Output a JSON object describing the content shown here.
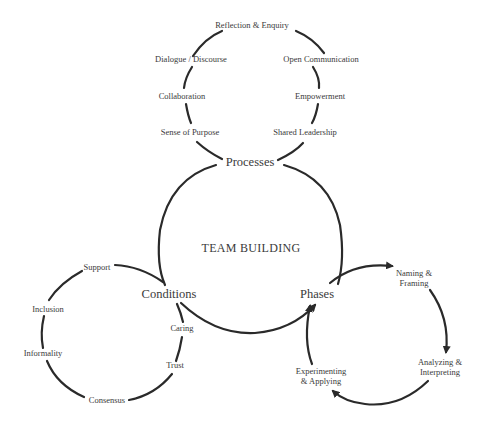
{
  "diagram": {
    "center_title": "TEAM BUILDING",
    "nodes": {
      "processes": "Processes",
      "conditions": "Conditions",
      "phases": "Phases"
    },
    "processes_cycle": [
      "Reflection & Enquiry",
      "Open Communication",
      "Empowerment",
      "Shared Leadership",
      "Sense of Purpose",
      "Collaboration",
      "Dialogue / Discourse"
    ],
    "conditions_cycle": [
      "Support",
      "Inclusion",
      "Informality",
      "Consensus",
      "Trust",
      "Caring"
    ],
    "phases_cycle": [
      {
        "line1": "Naming &",
        "line2": "Framing"
      },
      {
        "line1": "Analyzing &",
        "line2": "Interpreting"
      },
      {
        "line1": "Experimenting",
        "line2": "& Applying"
      }
    ],
    "colors": {
      "stroke": "#2a2a2a",
      "text": "#3a3a3a",
      "background": "#ffffff"
    }
  }
}
